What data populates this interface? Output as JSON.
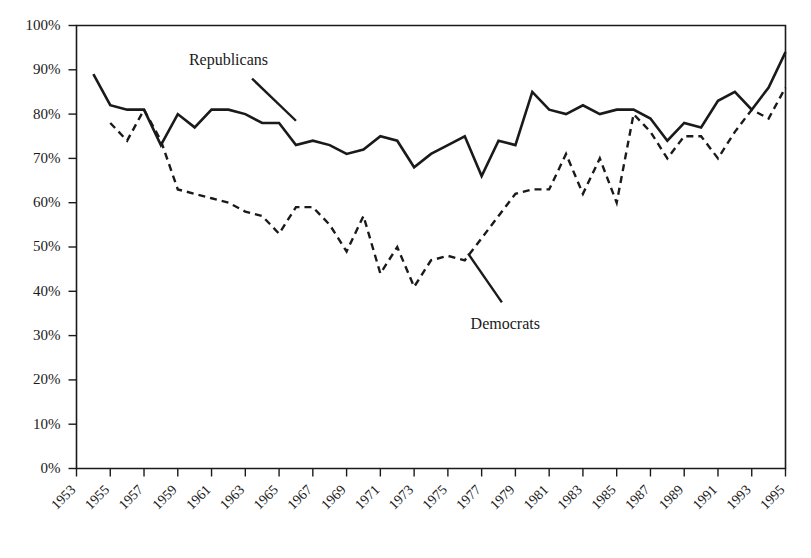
{
  "chart_data": {
    "type": "line",
    "title": "",
    "subtitle": "",
    "xlabel": "",
    "ylabel": "",
    "xlim": [
      1953,
      1995
    ],
    "ylim": [
      0,
      100
    ],
    "grid": false,
    "legend_position": "inline-annotation",
    "y_tick_labels": [
      "100%",
      "90%",
      "80%",
      "70%",
      "60%",
      "50%",
      "40%",
      "30%",
      "20%",
      "10%",
      "0%"
    ],
    "y_tick_values": [
      100,
      90,
      80,
      70,
      60,
      50,
      40,
      30,
      20,
      10,
      0
    ],
    "x_tick_labels": [
      "1953",
      "1955",
      "1957",
      "1959",
      "1961",
      "1963",
      "1965",
      "1967",
      "1969",
      "1971",
      "1973",
      "1975",
      "1977",
      "1979",
      "1981",
      "1983",
      "1985",
      "1987",
      "1989",
      "1991",
      "1993",
      "1995"
    ],
    "x_tick_values": [
      1953,
      1955,
      1957,
      1959,
      1961,
      1963,
      1965,
      1967,
      1969,
      1971,
      1973,
      1975,
      1977,
      1979,
      1981,
      1983,
      1985,
      1987,
      1989,
      1991,
      1993,
      1995
    ],
    "annotations": [
      {
        "name": "republicans-label",
        "text": "Republicans",
        "x": 1962.0,
        "y": 91.0,
        "leader_from": [
          1963.4,
          88.0
        ],
        "leader_to": [
          1966.0,
          78.5
        ]
      },
      {
        "name": "democrats-label",
        "text": "Democrats",
        "x": 1978.4,
        "y": 31.5,
        "leader_from": [
          1976.2,
          48.5
        ],
        "leader_to": [
          1978.2,
          37.5
        ]
      }
    ],
    "series": [
      {
        "name": "Republicans",
        "style": "solid",
        "color": "#1a1a1a",
        "x": [
          1954,
          1955,
          1956,
          1957,
          1958,
          1959,
          1960,
          1961,
          1962,
          1963,
          1964,
          1965,
          1966,
          1967,
          1968,
          1969,
          1970,
          1971,
          1972,
          1973,
          1974,
          1975,
          1976,
          1977,
          1978,
          1979,
          1980,
          1981,
          1982,
          1983,
          1984,
          1985,
          1986,
          1987,
          1988,
          1989,
          1990,
          1991,
          1992,
          1993,
          1994,
          1995
        ],
        "values": [
          89,
          82,
          81,
          81,
          73,
          80,
          77,
          81,
          81,
          80,
          78,
          78,
          73,
          74,
          73,
          71,
          72,
          75,
          74,
          68,
          71,
          73,
          75,
          66,
          74,
          73,
          85,
          81,
          80,
          82,
          80,
          81,
          81,
          79,
          74,
          78,
          77,
          83,
          85,
          81,
          86,
          94
        ],
        "ymin": 66,
        "ymax": 94
      },
      {
        "name": "Democrats",
        "style": "dashed",
        "color": "#1a1a1a",
        "x": [
          1955,
          1956,
          1957,
          1958,
          1959,
          1960,
          1961,
          1962,
          1963,
          1964,
          1965,
          1966,
          1967,
          1968,
          1969,
          1970,
          1971,
          1972,
          1973,
          1974,
          1975,
          1976,
          1977,
          1978,
          1979,
          1980,
          1981,
          1982,
          1983,
          1984,
          1985,
          1986,
          1987,
          1988,
          1989,
          1990,
          1991,
          1992,
          1993,
          1994,
          1995
        ],
        "values": [
          78,
          74,
          81,
          74,
          63,
          62,
          61,
          60,
          58,
          57,
          53,
          59,
          59,
          55,
          49,
          57,
          44,
          50,
          41,
          47,
          48,
          47,
          52,
          57,
          62,
          63,
          63,
          71,
          62,
          70,
          60,
          80,
          76,
          70,
          75,
          75,
          70,
          76,
          81,
          79,
          86
        ],
        "ymin": 41,
        "ymax": 86
      }
    ]
  }
}
